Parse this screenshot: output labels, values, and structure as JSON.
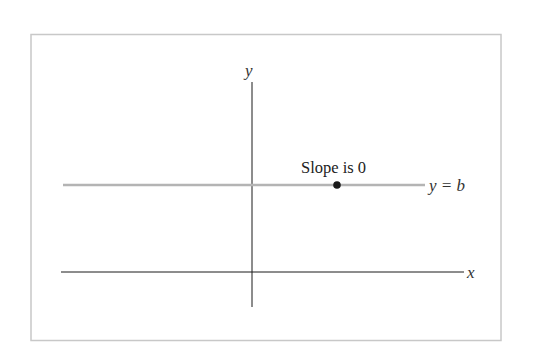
{
  "figure": {
    "frame_color": "#c8c8c8",
    "axis_color": "#1a1a1a",
    "line_color": "#b4b4b4",
    "point_color": "#1a1a1a",
    "labels": {
      "y_axis": "y",
      "x_axis": "x",
      "line_equation": "y = b",
      "annotation": "Slope is 0"
    }
  }
}
